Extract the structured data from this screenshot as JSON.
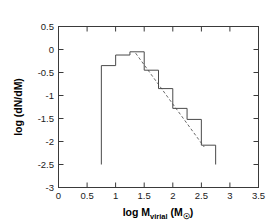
{
  "chart_data": {
    "type": "line",
    "title": "",
    "xlabel": "log M_virial (M_sun)",
    "ylabel": "log (dN/dM)",
    "xlim": [
      0,
      3.5
    ],
    "ylim": [
      -3,
      0.5
    ],
    "grid": false,
    "legend": "none",
    "xticks": [
      0,
      0.5,
      1,
      1.5,
      2,
      2.5,
      3,
      3.5
    ],
    "xtick_labels": [
      "0",
      "0.5",
      "1",
      "1.5",
      "2",
      "2.5",
      "3",
      "3.5"
    ],
    "yticks": [
      0.5,
      0,
      -0.5,
      -1,
      -1.5,
      -2,
      -2.5,
      -3
    ],
    "ytick_labels": [
      "0.5",
      "0",
      "-0.5",
      "-1",
      "-1.5",
      "-2",
      "-2.5",
      "-3"
    ],
    "series": [
      {
        "name": "mass function histogram",
        "style": "step",
        "color": "#4a4a4a",
        "bin_edges": [
          0.75,
          1.0,
          1.25,
          1.5,
          1.75,
          2.0,
          2.25,
          2.5,
          2.75
        ],
        "values": [
          -0.35,
          -0.12,
          -0.05,
          -0.45,
          -0.85,
          -1.28,
          -1.52,
          -2.08
        ],
        "baseline": -2.5
      },
      {
        "name": "power-law fit",
        "style": "dashed",
        "color": "#6a6a6a",
        "x": [
          1.35,
          2.55
        ],
        "y": [
          -0.08,
          -2.12
        ]
      }
    ]
  },
  "axis_labels": {
    "y_title": "log (dN/dM)",
    "x_title_main": "log M",
    "x_title_sub": "virial",
    "x_title_unit_open": " (M",
    "x_title_unit_sub": "☉",
    "x_title_unit_close": ")"
  },
  "colors": {
    "background": "#ffffff",
    "axis": "#3a3a3a",
    "histogram": "#4a4a4a",
    "fit": "#6a6a6a",
    "text": "#000000"
  }
}
